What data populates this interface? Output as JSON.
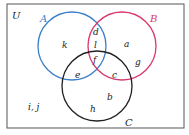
{
  "diagram": {
    "type": "venn",
    "universe_label": "U",
    "sets": [
      {
        "name": "A",
        "color": "#3a7fc8"
      },
      {
        "name": "B",
        "color": "#d8396e"
      },
      {
        "name": "C",
        "color": "#222222"
      }
    ],
    "regions": {
      "A_only": "k",
      "A_and_B_only": "d",
      "A_and_B_and_C_upper": "l",
      "A_and_B_and_C": "f",
      "A_and_C_only": "e",
      "B_only_upper": "a",
      "B_only_lower": "g",
      "B_and_C_only": "c",
      "C_only_right": "b",
      "C_only_bottom": "h",
      "outside": "i, j"
    }
  }
}
